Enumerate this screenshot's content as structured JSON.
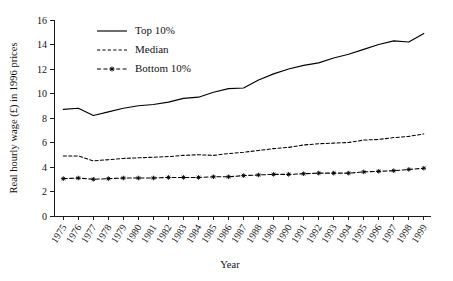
{
  "chart_data": {
    "type": "line",
    "title": "",
    "xlabel": "Year",
    "ylabel": "Real hourly wage (£) in 1996 prices",
    "ylim": [
      0,
      16
    ],
    "yticks": [
      0,
      2,
      4,
      6,
      8,
      10,
      12,
      14,
      16
    ],
    "grid": false,
    "legend_position": "top-left-inside",
    "categories": [
      "1975",
      "1976",
      "1977",
      "1978",
      "1979",
      "1980",
      "1981",
      "1982",
      "1983",
      "1984",
      "1985",
      "1986",
      "1987",
      "1988",
      "1989",
      "1990",
      "1991",
      "1992",
      "1993",
      "1994",
      "1995",
      "1996",
      "1997",
      "1998",
      "1999"
    ],
    "series": [
      {
        "name": "Top 10%",
        "style": "solid",
        "marker": "none",
        "values": [
          8.7,
          8.8,
          8.2,
          8.5,
          8.8,
          9.0,
          9.1,
          9.3,
          9.6,
          9.7,
          10.1,
          10.4,
          10.45,
          11.1,
          11.6,
          12.0,
          12.3,
          12.5,
          12.9,
          13.2,
          13.6,
          14.0,
          14.3,
          14.2,
          14.9
        ]
      },
      {
        "name": "Median",
        "style": "dashed",
        "marker": "none",
        "values": [
          4.9,
          4.9,
          4.5,
          4.6,
          4.7,
          4.75,
          4.8,
          4.85,
          4.95,
          5.0,
          4.95,
          5.1,
          5.2,
          5.35,
          5.5,
          5.6,
          5.8,
          5.9,
          5.95,
          6.0,
          6.2,
          6.25,
          6.4,
          6.5,
          6.7
        ]
      },
      {
        "name": "Bottom 10%",
        "style": "dash-dot",
        "marker": "asterisk",
        "values": [
          3.05,
          3.1,
          3.0,
          3.05,
          3.1,
          3.1,
          3.1,
          3.15,
          3.15,
          3.15,
          3.2,
          3.2,
          3.3,
          3.35,
          3.4,
          3.4,
          3.45,
          3.5,
          3.5,
          3.5,
          3.6,
          3.65,
          3.7,
          3.8,
          3.9
        ]
      }
    ]
  },
  "legend": {
    "items": [
      {
        "label": "Top 10%"
      },
      {
        "label": "Median"
      },
      {
        "label": "Bottom 10%"
      }
    ]
  },
  "colors": {
    "ink": "#000000",
    "background": "#ffffff"
  }
}
